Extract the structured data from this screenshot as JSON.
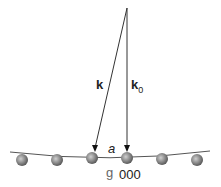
{
  "diagram": {
    "labels": {
      "k": "k",
      "k0_base": "k",
      "k0_sub": "0",
      "a": "a",
      "g": "g",
      "origin": "000"
    },
    "atoms": {
      "count": 6,
      "color": "#8a8a8a"
    }
  }
}
